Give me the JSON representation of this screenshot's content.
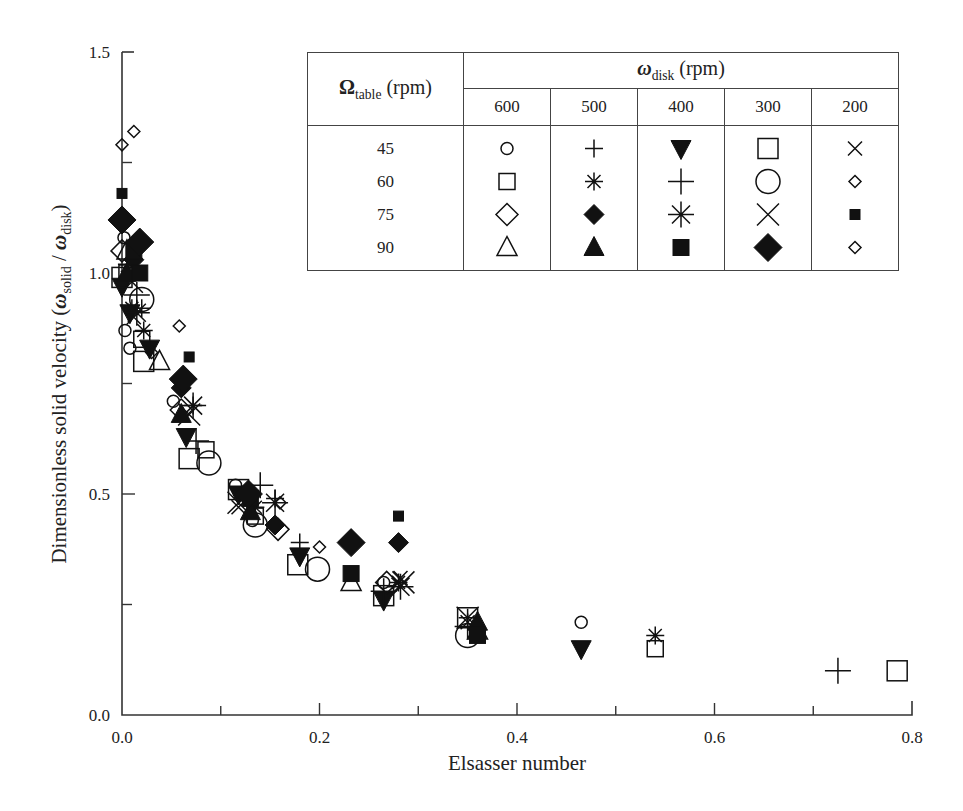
{
  "chart_data": {
    "type": "scatter",
    "title": "",
    "xlabel": "Elsasser number",
    "ylabel_parts": {
      "main": "Dimensionless solid velocity (",
      "num_symbol": "ω",
      "num_sub": "solid",
      "slash": " / ",
      "den_symbol": "ω",
      "den_sub": "disk",
      "close": ")"
    },
    "ylabel": "Dimensionless solid velocity (ω_solid / ω_disk)",
    "xlim": [
      0.0,
      0.8
    ],
    "ylim": [
      0.0,
      1.5
    ],
    "x_ticks": [
      0.0,
      0.1,
      0.2,
      0.3,
      0.4,
      0.5,
      0.6,
      0.7,
      0.8
    ],
    "x_tick_labels": [
      "0.0",
      "",
      "0.2",
      "",
      "0.4",
      "",
      "0.6",
      "",
      "0.8"
    ],
    "y_ticks": [
      0.0,
      0.25,
      0.5,
      0.75,
      1.0,
      1.25,
      1.5
    ],
    "y_tick_labels": [
      "0.0",
      "",
      "0.5",
      "",
      "1.0",
      "",
      "1.5"
    ],
    "grid": false,
    "legend_position": "upper right (table)",
    "legend": {
      "row_header_symbol": "Ω",
      "row_header_sub": "table",
      "row_header_unit": " (rpm)",
      "col_header_symbol": "ω",
      "col_header_sub": "disk",
      "col_header_unit": " (rpm)",
      "columns": [
        "600",
        "500",
        "400",
        "300",
        "200"
      ],
      "rows": [
        "45",
        "60",
        "75",
        "90"
      ],
      "markers": [
        [
          "circle-open-small",
          "plus-small",
          "triangle-down-filled",
          "square-open-large",
          "x-small"
        ],
        [
          "square-open-small",
          "asterisk-small",
          "plus-large",
          "circle-open-large",
          "diamond-open-tiny"
        ],
        [
          "diamond-open-small",
          "diamond-filled-small",
          "asterisk-large",
          "x-large",
          "square-filled-tiny"
        ],
        [
          "triangle-up-open",
          "triangle-up-filled",
          "square-filled",
          "diamond-filled-large",
          "diamond-open-tiny"
        ]
      ]
    },
    "series": [
      {
        "name": "Ωtable=45, ωdisk=600",
        "marker": "circle-open-small",
        "points": [
          [
            0.002,
            1.08
          ],
          [
            0.003,
            0.87
          ],
          [
            0.008,
            0.83
          ],
          [
            0.052,
            0.71
          ],
          [
            0.115,
            0.52
          ],
          [
            0.132,
            0.44
          ],
          [
            0.265,
            0.3
          ],
          [
            0.465,
            0.21
          ]
        ]
      },
      {
        "name": "Ωtable=45, ωdisk=500",
        "marker": "plus-small",
        "points": [
          [
            0.005,
            1.02
          ],
          [
            0.02,
            0.92
          ],
          [
            0.072,
            0.7
          ],
          [
            0.155,
            0.49
          ],
          [
            0.18,
            0.39
          ],
          [
            0.35,
            0.22
          ]
        ]
      },
      {
        "name": "Ωtable=45, ωdisk=400",
        "marker": "triangle-down-filled",
        "points": [
          [
            0.0,
            0.97
          ],
          [
            0.008,
            0.91
          ],
          [
            0.028,
            0.83
          ],
          [
            0.065,
            0.63
          ],
          [
            0.118,
            0.5
          ],
          [
            0.18,
            0.36
          ],
          [
            0.265,
            0.26
          ],
          [
            0.465,
            0.15
          ]
        ]
      },
      {
        "name": "Ωtable=45, ωdisk=300",
        "marker": "square-open-large",
        "points": [
          [
            0.0,
            0.99
          ],
          [
            0.022,
            0.8
          ],
          [
            0.068,
            0.58
          ],
          [
            0.118,
            0.51
          ],
          [
            0.178,
            0.34
          ],
          [
            0.265,
            0.27
          ],
          [
            0.35,
            0.22
          ],
          [
            0.785,
            0.1
          ]
        ]
      },
      {
        "name": "Ωtable=45, ωdisk=200",
        "marker": "x-small",
        "points": [
          [
            0.012,
            0.9
          ],
          [
            0.118,
            0.47
          ],
          [
            0.282,
            0.31
          ],
          [
            0.35,
            0.21
          ]
        ]
      },
      {
        "name": "Ωtable=60, ωdisk=600",
        "marker": "square-open-small",
        "points": [
          [
            0.005,
            1.0
          ],
          [
            0.02,
            0.85
          ],
          [
            0.085,
            0.6
          ],
          [
            0.135,
            0.45
          ],
          [
            0.54,
            0.15
          ]
        ]
      },
      {
        "name": "Ωtable=60, ωdisk=500",
        "marker": "asterisk-small",
        "points": [
          [
            0.01,
            0.92
          ],
          [
            0.022,
            0.87
          ],
          [
            0.135,
            0.47
          ],
          [
            0.28,
            0.3
          ],
          [
            0.54,
            0.18
          ]
        ]
      },
      {
        "name": "Ωtable=60, ωdisk=400",
        "marker": "plus-large",
        "points": [
          [
            0.015,
            0.95
          ],
          [
            0.075,
            0.62
          ],
          [
            0.14,
            0.52
          ],
          [
            0.265,
            0.28
          ],
          [
            0.35,
            0.2
          ],
          [
            0.725,
            0.1
          ]
        ]
      },
      {
        "name": "Ωtable=60, ωdisk=300",
        "marker": "circle-open-large",
        "points": [
          [
            0.02,
            0.94
          ],
          [
            0.088,
            0.57
          ],
          [
            0.135,
            0.43
          ],
          [
            0.198,
            0.33
          ],
          [
            0.35,
            0.18
          ]
        ]
      },
      {
        "name": "Ωtable=60, ωdisk=200",
        "marker": "diamond-open-tiny",
        "points": [
          [
            0.012,
            1.32
          ],
          [
            0.058,
            0.88
          ],
          [
            0.16,
            0.48
          ],
          [
            0.2,
            0.38
          ]
        ]
      },
      {
        "name": "Ωtable=75, ωdisk=600",
        "marker": "diamond-open-small",
        "points": [
          [
            0.0,
            1.05
          ],
          [
            0.06,
            0.69
          ],
          [
            0.158,
            0.42
          ],
          [
            0.268,
            0.3
          ]
        ]
      },
      {
        "name": "Ωtable=75, ωdisk=500",
        "marker": "diamond-filled-small",
        "points": [
          [
            0.012,
            1.03
          ],
          [
            0.06,
            0.74
          ],
          [
            0.155,
            0.43
          ],
          [
            0.28,
            0.39
          ]
        ]
      },
      {
        "name": "Ωtable=75, ωdisk=400",
        "marker": "asterisk-large",
        "points": [
          [
            0.015,
            0.91
          ],
          [
            0.072,
            0.7
          ],
          [
            0.155,
            0.48
          ],
          [
            0.282,
            0.29
          ]
        ]
      },
      {
        "name": "Ωtable=75, ωdisk=300",
        "marker": "x-large",
        "points": [
          [
            0.01,
            0.98
          ],
          [
            0.068,
            0.68
          ],
          [
            0.118,
            0.48
          ],
          [
            0.285,
            0.3
          ],
          [
            0.35,
            0.22
          ]
        ]
      },
      {
        "name": "Ωtable=75, ωdisk=200",
        "marker": "square-filled-tiny",
        "points": [
          [
            0.0,
            1.18
          ],
          [
            0.068,
            0.81
          ],
          [
            0.28,
            0.45
          ]
        ]
      },
      {
        "name": "Ωtable=90, ωdisk=600",
        "marker": "triangle-up-open",
        "points": [
          [
            0.005,
            1.05
          ],
          [
            0.038,
            0.8
          ],
          [
            0.232,
            0.3
          ],
          [
            0.36,
            0.19
          ]
        ]
      },
      {
        "name": "Ωtable=90, ωdisk=500",
        "marker": "triangle-up-filled",
        "points": [
          [
            0.005,
            1.0
          ],
          [
            0.06,
            0.68
          ],
          [
            0.13,
            0.46
          ],
          [
            0.36,
            0.21
          ]
        ]
      },
      {
        "name": "Ωtable=90, ωdisk=400",
        "marker": "square-filled",
        "points": [
          [
            0.018,
            1.0
          ],
          [
            0.012,
            1.05
          ],
          [
            0.13,
            0.49
          ],
          [
            0.232,
            0.32
          ],
          [
            0.36,
            0.18
          ]
        ]
      },
      {
        "name": "Ωtable=90, ωdisk=300",
        "marker": "diamond-filled-large",
        "points": [
          [
            0.0,
            1.12
          ],
          [
            0.018,
            1.07
          ],
          [
            0.062,
            0.76
          ],
          [
            0.128,
            0.5
          ],
          [
            0.232,
            0.39
          ]
        ]
      },
      {
        "name": "Ωtable=90, ωdisk=200",
        "marker": "diamond-open-tiny",
        "points": [
          [
            0.0,
            1.29
          ],
          [
            0.03,
            0.82
          ]
        ]
      }
    ]
  }
}
